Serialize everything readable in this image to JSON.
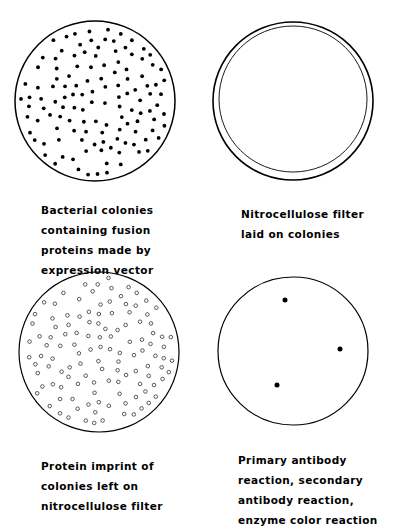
{
  "panels": [
    {
      "id": "bacterial-colonies",
      "caption_lines": [
        "Bacterial colonies",
        "containing fusion",
        "proteins made by",
        "expression vector"
      ],
      "dot_style": "filled"
    },
    {
      "id": "nitrocellulose-filter",
      "caption_lines": [
        "Nitrocellulose filter",
        "laid on colonies"
      ],
      "dot_style": "none"
    },
    {
      "id": "protein-imprint",
      "caption_lines": [
        "Protein imprint of",
        "colonies left on",
        "nitrocellulose filter"
      ],
      "dot_style": "hollow"
    },
    {
      "id": "antibody-reaction",
      "caption_lines": [
        "Primary antibody",
        "reaction, secondary",
        "antibody reaction,",
        "enzyme color reaction"
      ],
      "dot_style": "filled",
      "positive_spots": 3
    }
  ],
  "colors": {
    "ink": "#000000",
    "background": "#ffffff"
  }
}
